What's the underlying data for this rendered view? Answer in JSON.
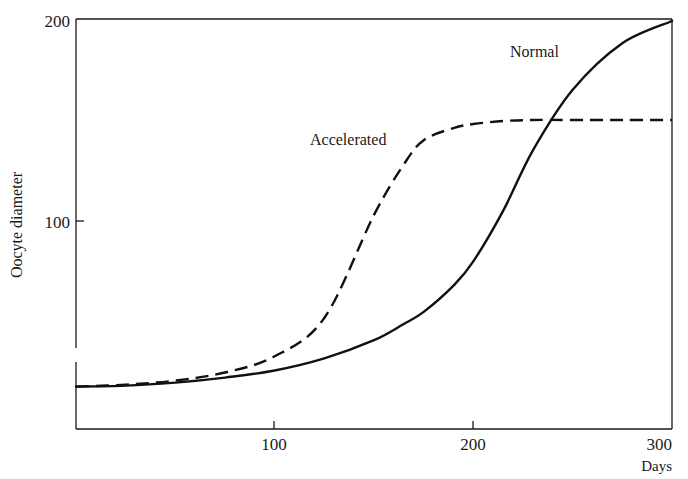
{
  "chart_data": {
    "type": "line",
    "title": "",
    "xlabel": "Days",
    "ylabel": "Oocyte diameter",
    "xlim": [
      0,
      300
    ],
    "ylim": [
      0,
      200
    ],
    "x_ticks": [
      100,
      200,
      300
    ],
    "x_tick_labels": [
      "100",
      "200",
      "300"
    ],
    "y_ticks": [
      100,
      200
    ],
    "y_tick_labels": [
      "100",
      "200"
    ],
    "grid": false,
    "legend": "inline labels on curves",
    "annotations": [
      {
        "text": "Normal",
        "series": "Normal",
        "x": 260,
        "y": 196
      },
      {
        "text": "Accelerated",
        "series": "Accelerated",
        "x": 120,
        "y": 141
      }
    ],
    "x": [
      0,
      25,
      50,
      75,
      100,
      125,
      150,
      165,
      175,
      190,
      200,
      215,
      230,
      250,
      275,
      300
    ],
    "series": [
      {
        "name": "Normal",
        "style": "solid",
        "values": [
          18,
          18.5,
          20,
          22.5,
          26,
          32,
          41,
          49,
          55,
          68,
          80,
          105,
          135,
          165,
          188,
          199
        ]
      },
      {
        "name": "Accelerated",
        "style": "dashed",
        "values": [
          18,
          19,
          21,
          25,
          33,
          52,
          103,
          128,
          140,
          146,
          148,
          149.5,
          150,
          150,
          150,
          150
        ]
      }
    ]
  },
  "labels": {
    "y_axis_title": "Oocyte diameter",
    "x_axis_title": "Days",
    "y_tick_200": "200",
    "y_tick_100": "100",
    "x_tick_100": "100",
    "x_tick_200": "200",
    "x_tick_300": "300",
    "curve_normal": "Normal",
    "curve_accelerated": "Accelerated"
  }
}
